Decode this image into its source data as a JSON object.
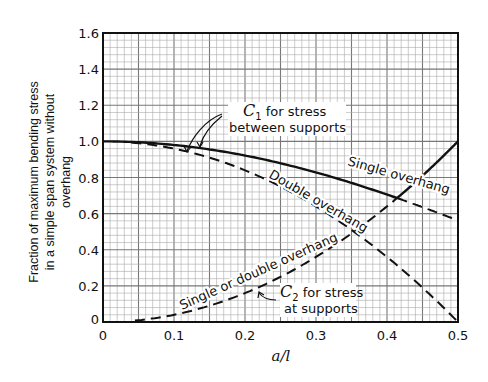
{
  "chart_data": {
    "type": "line",
    "title": "",
    "xlabel": "a/l",
    "ylabel": "Fraction of maximum bending stress in a simple span system without overhang",
    "ylabel_lines": [
      "Fraction of maximum bending stress",
      "in a simple span system without",
      "overhang"
    ],
    "xlim": [
      0,
      0.5
    ],
    "ylim": [
      0,
      1.6
    ],
    "grid": true,
    "x_ticks": [
      "0",
      "0.1",
      "0.2",
      "0.3",
      "0.4",
      "0.5"
    ],
    "y_ticks": [
      "0",
      "0.2",
      "0.4",
      "0.6",
      "0.8",
      "1.0",
      "1.2",
      "1.4",
      "1.6"
    ],
    "x": [
      0,
      0.05,
      0.1,
      0.15,
      0.2,
      0.25,
      0.3,
      0.35,
      0.4,
      0.45,
      0.5
    ],
    "series": [
      {
        "name": "C1 Single overhang",
        "style": "solid then dashed after C2 crossing",
        "values": [
          1.0,
          0.995,
          0.98,
          0.956,
          0.922,
          0.879,
          0.828,
          0.77,
          0.706,
          0.636,
          0.563
        ]
      },
      {
        "name": "C1 Double overhang",
        "style": "dashed",
        "values": [
          1.0,
          0.99,
          0.96,
          0.91,
          0.84,
          0.75,
          0.64,
          0.51,
          0.36,
          0.19,
          0.0
        ]
      },
      {
        "name": "C2 Single or double overhang",
        "style": "dashed then solid after crossing",
        "values": [
          0.0,
          0.01,
          0.04,
          0.09,
          0.16,
          0.25,
          0.36,
          0.49,
          0.64,
          0.81,
          1.0
        ]
      }
    ],
    "annotations": [
      {
        "text_main": "C",
        "subscript": "1",
        "text_rest": " for stress",
        "line2": "between supports"
      },
      {
        "text_main": "C",
        "subscript": "2",
        "text_rest": " for stress",
        "line2": "at supports"
      },
      {
        "text": "Single overhang"
      },
      {
        "text": "Double overhang"
      },
      {
        "text": "Single or double overhang"
      }
    ]
  }
}
